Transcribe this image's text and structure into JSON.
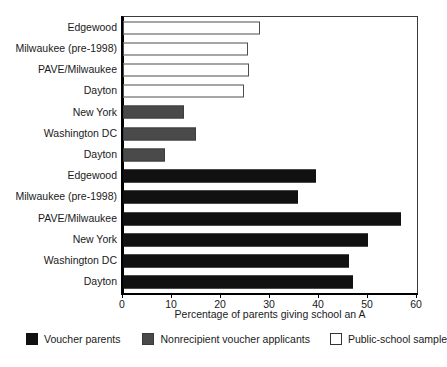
{
  "chart_data": {
    "type": "bar",
    "orientation": "horizontal",
    "title": "",
    "xlabel": "Percentage of parents giving school an A",
    "ylabel": "",
    "xlim": [
      0,
      60
    ],
    "xticks": [
      0,
      10,
      20,
      30,
      40,
      50,
      60
    ],
    "grid": false,
    "legend_position": "bottom",
    "legend": [
      {
        "label": "Voucher parents",
        "color": "#111111",
        "style": "filled-black"
      },
      {
        "label": "Nonrecipient voucher applicants",
        "color": "#4a4a4a",
        "style": "filled-gray"
      },
      {
        "label": "Public-school sample",
        "color": "#ffffff",
        "style": "outlined-white"
      }
    ],
    "bars": [
      {
        "category": "Edgewood",
        "value": 28.0,
        "series": "Public-school sample"
      },
      {
        "category": "Milwaukee (pre-1998)",
        "value": 25.5,
        "series": "Public-school sample"
      },
      {
        "category": "PAVE/Milwaukee",
        "value": 25.8,
        "series": "Public-school sample"
      },
      {
        "category": "Dayton",
        "value": 24.6,
        "series": "Public-school sample"
      },
      {
        "category": "New York",
        "value": 12.4,
        "series": "Nonrecipient voucher applicants"
      },
      {
        "category": "Washington DC",
        "value": 14.8,
        "series": "Nonrecipient voucher applicants"
      },
      {
        "category": "Dayton",
        "value": 8.5,
        "series": "Nonrecipient voucher applicants"
      },
      {
        "category": "Edgewood",
        "value": 39.3,
        "series": "Voucher parents"
      },
      {
        "category": "Milwaukee (pre-1998)",
        "value": 35.7,
        "series": "Voucher parents"
      },
      {
        "category": "PAVE/Milwaukee",
        "value": 56.8,
        "series": "Voucher parents"
      },
      {
        "category": "New York",
        "value": 50.0,
        "series": "Voucher parents"
      },
      {
        "category": "Washington DC",
        "value": 46.2,
        "series": "Voucher parents"
      },
      {
        "category": "Dayton",
        "value": 47.0,
        "series": "Voucher parents"
      }
    ]
  },
  "colors": {
    "voucher_parents": "#111111",
    "nonrecipient_applicants": "#4a4a4a",
    "public_school_sample": "#ffffff",
    "axis": "#000000",
    "frame": "#3a3a3a"
  }
}
